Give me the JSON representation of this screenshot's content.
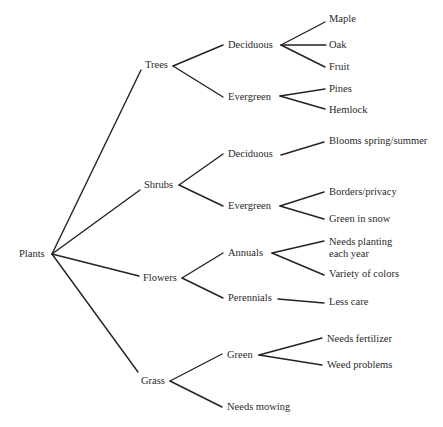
{
  "diagram": {
    "root": {
      "id": "plants",
      "label": "Plants",
      "x": 19,
      "y": 254,
      "anchor": [
        52,
        254
      ]
    },
    "nodes": [
      {
        "id": "trees",
        "label": "Trees",
        "x": 145,
        "y": 65,
        "in": [
          141,
          70
        ],
        "out": [
          173,
          66
        ]
      },
      {
        "id": "trees-deciduous",
        "label": "Deciduous",
        "x": 228,
        "y": 45,
        "in": [
          223,
          45
        ],
        "out": [
          281,
          45
        ]
      },
      {
        "id": "trees-evergreen",
        "label": "Evergreen",
        "x": 228,
        "y": 97,
        "in": [
          223,
          97
        ],
        "out": [
          280,
          96
        ]
      },
      {
        "id": "maple",
        "label": "Maple",
        "x": 329,
        "y": 19,
        "in": [
          325,
          22
        ]
      },
      {
        "id": "oak",
        "label": "Oak",
        "x": 329,
        "y": 45,
        "in": [
          326,
          45
        ]
      },
      {
        "id": "fruit",
        "label": "Fruit",
        "x": 329,
        "y": 67,
        "in": [
          325,
          67
        ]
      },
      {
        "id": "pines",
        "label": "Pines",
        "x": 329,
        "y": 89,
        "in": [
          325,
          89
        ]
      },
      {
        "id": "hemlock",
        "label": "Hemlock",
        "x": 329,
        "y": 110,
        "in": [
          325,
          109
        ]
      },
      {
        "id": "shrubs",
        "label": "Shrubs",
        "x": 144,
        "y": 185,
        "in": [
          140,
          190
        ],
        "out": [
          179,
          185
        ]
      },
      {
        "id": "shrubs-deciduous",
        "label": "Deciduous",
        "x": 228,
        "y": 154,
        "in": [
          223,
          154
        ],
        "out": [
          281,
          155
        ]
      },
      {
        "id": "shrubs-evergreen",
        "label": "Evergreen",
        "x": 228,
        "y": 206,
        "in": [
          223,
          206
        ],
        "out": [
          280,
          206
        ]
      },
      {
        "id": "blooms",
        "label": "Blooms spring/summer",
        "x": 329,
        "y": 141,
        "in": [
          324,
          142
        ]
      },
      {
        "id": "borders",
        "label": "Borders/privacy",
        "x": 329,
        "y": 192,
        "in": [
          324,
          192
        ]
      },
      {
        "id": "green-in-snow",
        "label": "Green in snow",
        "x": 329,
        "y": 219,
        "in": [
          324,
          219
        ]
      },
      {
        "id": "flowers",
        "label": "Flowers",
        "x": 143,
        "y": 278,
        "in": [
          139,
          276
        ],
        "out": [
          182,
          278
        ]
      },
      {
        "id": "annuals",
        "label": "Annuals",
        "x": 228,
        "y": 253,
        "in": [
          223,
          253
        ],
        "out": [
          272,
          253
        ]
      },
      {
        "id": "perennials",
        "label": "Perennials",
        "x": 228,
        "y": 298,
        "in": [
          223,
          298
        ],
        "out": [
          278,
          299
        ]
      },
      {
        "id": "needs-planting",
        "label": "Needs planting\neach year",
        "x": 329,
        "y": 242,
        "in": [
          324,
          241
        ],
        "multi": true
      },
      {
        "id": "variety",
        "label": "Variety of colors",
        "x": 329,
        "y": 274,
        "in": [
          324,
          275
        ]
      },
      {
        "id": "less-care",
        "label": "Less care",
        "x": 329,
        "y": 302,
        "in": [
          324,
          303
        ]
      },
      {
        "id": "grass",
        "label": "Grass",
        "x": 141,
        "y": 381,
        "in": [
          138,
          372
        ],
        "out": [
          170,
          381
        ]
      },
      {
        "id": "grass-green",
        "label": "Green",
        "x": 227,
        "y": 355,
        "in": [
          222,
          354
        ],
        "out": [
          259,
          355
        ]
      },
      {
        "id": "needs-mowing",
        "label": "Needs mowing",
        "x": 227,
        "y": 407,
        "in": [
          222,
          407
        ]
      },
      {
        "id": "needs-fertilizer",
        "label": "Needs fertilizer",
        "x": 327,
        "y": 339,
        "in": [
          322,
          338
        ]
      },
      {
        "id": "weed-problems",
        "label": "Weed problems",
        "x": 327,
        "y": 365,
        "in": [
          322,
          365
        ]
      }
    ],
    "edges": [
      [
        "plants",
        "trees"
      ],
      [
        "plants",
        "shrubs"
      ],
      [
        "plants",
        "flowers"
      ],
      [
        "plants",
        "grass"
      ],
      [
        "trees",
        "trees-deciduous"
      ],
      [
        "trees",
        "trees-evergreen"
      ],
      [
        "trees-deciduous",
        "maple"
      ],
      [
        "trees-deciduous",
        "oak"
      ],
      [
        "trees-deciduous",
        "fruit"
      ],
      [
        "trees-evergreen",
        "pines"
      ],
      [
        "trees-evergreen",
        "hemlock"
      ],
      [
        "shrubs",
        "shrubs-deciduous"
      ],
      [
        "shrubs",
        "shrubs-evergreen"
      ],
      [
        "shrubs-deciduous",
        "blooms"
      ],
      [
        "shrubs-evergreen",
        "borders"
      ],
      [
        "shrubs-evergreen",
        "green-in-snow"
      ],
      [
        "flowers",
        "annuals"
      ],
      [
        "flowers",
        "perennials"
      ],
      [
        "annuals",
        "needs-planting"
      ],
      [
        "annuals",
        "variety"
      ],
      [
        "perennials",
        "less-care"
      ],
      [
        "grass",
        "grass-green"
      ],
      [
        "grass",
        "needs-mowing"
      ],
      [
        "grass-green",
        "needs-fertilizer"
      ],
      [
        "grass-green",
        "weed-problems"
      ]
    ]
  },
  "caption": {
    "text": "",
    "note": "caption cut off at bottom edge; text not legible"
  }
}
